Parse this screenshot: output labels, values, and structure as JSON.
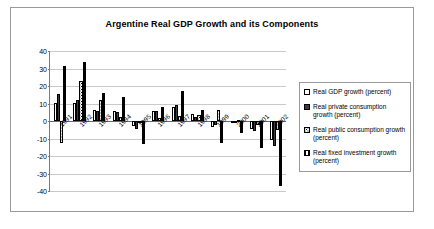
{
  "chart_data": {
    "type": "bar",
    "title": "Argentine Real GDP Growth and its Components",
    "xlabel": "",
    "ylabel": "",
    "ylim": [
      -40,
      40
    ],
    "yticks": [
      40,
      30,
      20,
      10,
      0,
      -10,
      -20,
      -30,
      -40
    ],
    "grid": true,
    "legend_position": "right",
    "categories": [
      "1991",
      "1992",
      "1993",
      "1994",
      "1995",
      "1996",
      "1997",
      "1998",
      "1999",
      "2000",
      "2001",
      "2002"
    ],
    "series": [
      {
        "name": "Real GDP growth (percent)",
        "pattern": "open",
        "values": [
          10.5,
          10.3,
          6.3,
          5.8,
          -2.8,
          5.5,
          8.1,
          3.9,
          -3.4,
          -0.8,
          -4.4,
          -10.9
        ]
      },
      {
        "name": "Real private consumption growth (percent)",
        "pattern": "solid",
        "values": [
          15.2,
          12.0,
          5.6,
          5.4,
          -4.4,
          5.5,
          9.0,
          2.5,
          -2.0,
          -0.7,
          -5.7,
          -14.4
        ]
      },
      {
        "name": "Real public consumption growth (percent)",
        "pattern": "dotted",
        "values": [
          -12.3,
          22.6,
          12.0,
          2.3,
          -0.6,
          1.9,
          3.1,
          3.3,
          6.3,
          0.6,
          -2.1,
          -5.1
        ]
      },
      {
        "name": "Real fixed investment growth (percent)",
        "pattern": "hatched",
        "values": [
          31.5,
          33.7,
          15.9,
          13.7,
          -13.1,
          8.0,
          17.4,
          6.3,
          -12.6,
          -6.8,
          -15.7,
          -36.9
        ]
      }
    ]
  },
  "legend": {
    "items": [
      {
        "label": "Real GDP growth (percent)"
      },
      {
        "label": "Real private consumption growth (percent)"
      },
      {
        "label": "Real public consumption growth (percent)"
      },
      {
        "label": "Real fixed investment growth (percent)"
      }
    ]
  }
}
